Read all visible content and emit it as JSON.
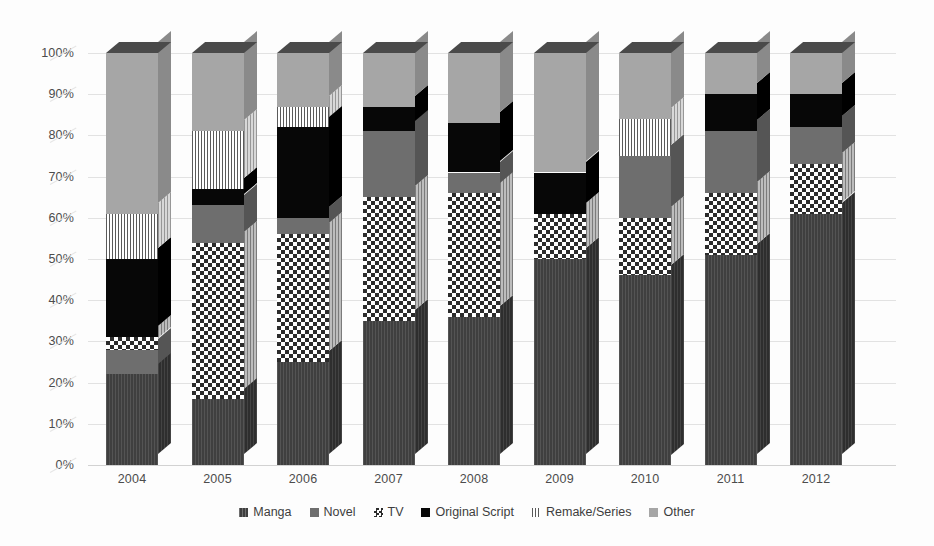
{
  "chart_data": {
    "type": "bar",
    "subtype": "100% stacked column (3D)",
    "title": "",
    "xlabel": "",
    "ylabel": "",
    "ylim": [
      0,
      100
    ],
    "yunit": "%",
    "grid": true,
    "legend_position": "bottom",
    "categories": [
      "2004",
      "2005",
      "2006",
      "2007",
      "2008",
      "2009",
      "2010",
      "2011",
      "2012"
    ],
    "y_ticks": [
      "0%",
      "10%",
      "20%",
      "30%",
      "40%",
      "50%",
      "60%",
      "70%",
      "80%",
      "90%",
      "100%"
    ],
    "series": [
      {
        "name": "Manga",
        "pattern": "dark-vertical-hatch",
        "color": "#3f3f3f",
        "values": [
          22,
          16,
          25,
          35,
          36,
          50,
          46,
          51,
          61
        ]
      },
      {
        "name": "Novel",
        "pattern": "medium-gray-solid",
        "color": "#6e6e6e",
        "values": [
          6,
          9,
          4,
          16,
          5,
          0,
          15,
          15,
          9
        ]
      },
      {
        "name": "TV",
        "pattern": "checkerboard",
        "color": "#2c2c2c",
        "values": [
          3,
          38,
          31,
          30,
          30,
          11,
          14,
          15,
          12
        ]
      },
      {
        "name": "Original Script",
        "pattern": "solid-black",
        "color": "#070707",
        "values": [
          19,
          4,
          22,
          6,
          12,
          10,
          0,
          9,
          8
        ]
      },
      {
        "name": "Remake/Series",
        "pattern": "fine-dotted",
        "color": "#5a5a5a",
        "values": [
          11,
          14,
          5,
          0,
          0,
          0,
          9,
          0,
          0
        ]
      },
      {
        "name": "Other",
        "pattern": "light-gray-solid",
        "color": "#a6a6a6",
        "values": [
          39,
          19,
          13,
          13,
          17,
          29,
          16,
          10,
          10
        ]
      }
    ],
    "stack_boundaries_percent": {
      "2004": {
        "Manga": [
          0,
          22
        ],
        "Novel": [
          22,
          28
        ],
        "TV": [
          28,
          31
        ],
        "Original Script": [
          31,
          50
        ],
        "Remake/Series": [
          50,
          61
        ],
        "Other": [
          61,
          100
        ]
      },
      "2005": {
        "Manga": [
          0,
          16
        ],
        "TV": [
          16,
          54
        ],
        "Novel": [
          54,
          63
        ],
        "Original Script": [
          63,
          67
        ],
        "Remake/Series": [
          67,
          81
        ],
        "Other": [
          81,
          100
        ]
      },
      "2006": {
        "Manga": [
          0,
          25
        ],
        "TV": [
          25,
          56
        ],
        "Novel": [
          56,
          60
        ],
        "Original Script": [
          60,
          82
        ],
        "Remake/Series": [
          82,
          87
        ],
        "Other": [
          87,
          100
        ]
      },
      "2007": {
        "Manga": [
          0,
          35
        ],
        "TV": [
          35,
          65
        ],
        "Novel": [
          65,
          81
        ],
        "Original Script": [
          81,
          87
        ],
        "Other": [
          87,
          100
        ]
      },
      "2008": {
        "Manga": [
          0,
          36
        ],
        "TV": [
          36,
          66
        ],
        "Novel": [
          66,
          71
        ],
        "Original Script": [
          71,
          83
        ],
        "Other": [
          83,
          100
        ]
      },
      "2009": {
        "Manga": [
          0,
          50
        ],
        "TV": [
          50,
          61
        ],
        "Original Script": [
          61,
          71
        ],
        "Other": [
          71,
          100
        ]
      },
      "2010": {
        "Manga": [
          0,
          46
        ],
        "TV": [
          46,
          60
        ],
        "Novel": [
          60,
          75
        ],
        "Remake/Series": [
          75,
          84
        ],
        "Other": [
          84,
          100
        ]
      },
      "2011": {
        "Manga": [
          0,
          51
        ],
        "TV": [
          51,
          66
        ],
        "Novel": [
          66,
          81
        ],
        "Original Script": [
          81,
          90
        ],
        "Other": [
          90,
          100
        ]
      },
      "2012": {
        "Manga": [
          0,
          61
        ],
        "TV": [
          61,
          73
        ],
        "Novel": [
          73,
          82
        ],
        "Original Script": [
          82,
          90
        ],
        "Other": [
          90,
          100
        ]
      }
    }
  },
  "legend": {
    "items": [
      {
        "label": "Manga",
        "swatch": "manga-swatch-icon"
      },
      {
        "label": "Novel",
        "swatch": "novel-swatch-icon"
      },
      {
        "label": "TV",
        "swatch": "tv-swatch-icon"
      },
      {
        "label": "Original Script",
        "swatch": "original-script-swatch-icon"
      },
      {
        "label": "Remake/Series",
        "swatch": "remake-series-swatch-icon"
      },
      {
        "label": "Other",
        "swatch": "other-swatch-icon"
      }
    ]
  }
}
